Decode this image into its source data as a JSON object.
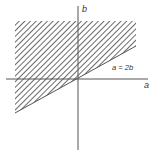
{
  "diagram": {
    "type": "region-plot",
    "axes": {
      "x_label": "a",
      "y_label": "b"
    },
    "line": {
      "label": "a = 2b",
      "equation": "a = 2b"
    },
    "region": {
      "description": "hatched half-plane above the line a = 2b",
      "fill": "diagonal-hatch"
    },
    "colors": {
      "axis": "#555555",
      "hatch": "#444444",
      "text": "#333333",
      "background": "#ffffff"
    }
  }
}
